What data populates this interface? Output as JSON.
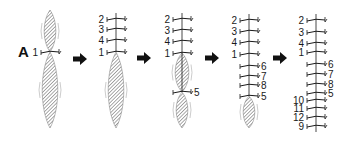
{
  "figure": {
    "panel_label": "A",
    "stages": [
      {
        "axis_x": 50,
        "bands": [
          {
            "y": 52,
            "label": "1",
            "side": "left"
          }
        ],
        "spindles": [
          {
            "top": 10,
            "bottom": 52,
            "w": 6
          },
          {
            "top": 52,
            "bottom": 128,
            "w": 8
          }
        ]
      },
      {
        "axis_x": 116,
        "bands": [
          {
            "y": 19,
            "label": "2",
            "side": "left"
          },
          {
            "y": 29,
            "label": "3",
            "side": "left"
          },
          {
            "y": 40,
            "label": "4",
            "side": "left"
          },
          {
            "y": 52,
            "label": "1",
            "side": "left"
          }
        ],
        "spindles": [
          {
            "top": 52,
            "bottom": 128,
            "w": 8
          }
        ]
      },
      {
        "axis_x": 182,
        "bands": [
          {
            "y": 19,
            "label": "2",
            "side": "left"
          },
          {
            "y": 30,
            "label": "3",
            "side": "left"
          },
          {
            "y": 41,
            "label": "4",
            "side": "left"
          },
          {
            "y": 53,
            "label": "1",
            "side": "left"
          },
          {
            "y": 92,
            "label": "5",
            "side": "right"
          }
        ],
        "spindles": [
          {
            "top": 53,
            "bottom": 92,
            "w": 7
          },
          {
            "top": 92,
            "bottom": 128,
            "w": 6
          }
        ]
      },
      {
        "axis_x": 249,
        "bands": [
          {
            "y": 20,
            "label": "2",
            "side": "left"
          },
          {
            "y": 31,
            "label": "3",
            "side": "left"
          },
          {
            "y": 42,
            "label": "4",
            "side": "left"
          },
          {
            "y": 54,
            "label": "1",
            "side": "left"
          },
          {
            "y": 66,
            "label": "6",
            "side": "right"
          },
          {
            "y": 76,
            "label": "7",
            "side": "right"
          },
          {
            "y": 85,
            "label": "8",
            "side": "right"
          },
          {
            "y": 96,
            "label": "5",
            "side": "right"
          }
        ],
        "spindles": [
          {
            "top": 96,
            "bottom": 128,
            "w": 6
          }
        ]
      },
      {
        "axis_x": 316,
        "bands": [
          {
            "y": 20,
            "label": "2",
            "side": "left"
          },
          {
            "y": 32,
            "label": "3",
            "side": "left"
          },
          {
            "y": 43,
            "label": "4",
            "side": "left"
          },
          {
            "y": 52,
            "label": "1",
            "side": "left"
          },
          {
            "y": 64,
            "label": "6",
            "side": "right"
          },
          {
            "y": 74,
            "label": "7",
            "side": "right"
          },
          {
            "y": 84,
            "label": "8",
            "side": "right"
          },
          {
            "y": 93,
            "label": "5",
            "side": "right"
          },
          {
            "y": 100,
            "label": "10",
            "side": "left"
          },
          {
            "y": 108,
            "label": "11",
            "side": "left"
          },
          {
            "y": 117,
            "label": "12",
            "side": "left"
          },
          {
            "y": 126,
            "label": "9",
            "side": "left"
          }
        ],
        "spindles": []
      }
    ],
    "arrows": [
      {
        "x": 73,
        "y": 59
      },
      {
        "x": 137,
        "y": 58
      },
      {
        "x": 205,
        "y": 58
      },
      {
        "x": 273,
        "y": 58
      }
    ],
    "colors": {
      "ink": "#1a1a1a",
      "hatch": "#555555",
      "background": "#ffffff"
    }
  }
}
